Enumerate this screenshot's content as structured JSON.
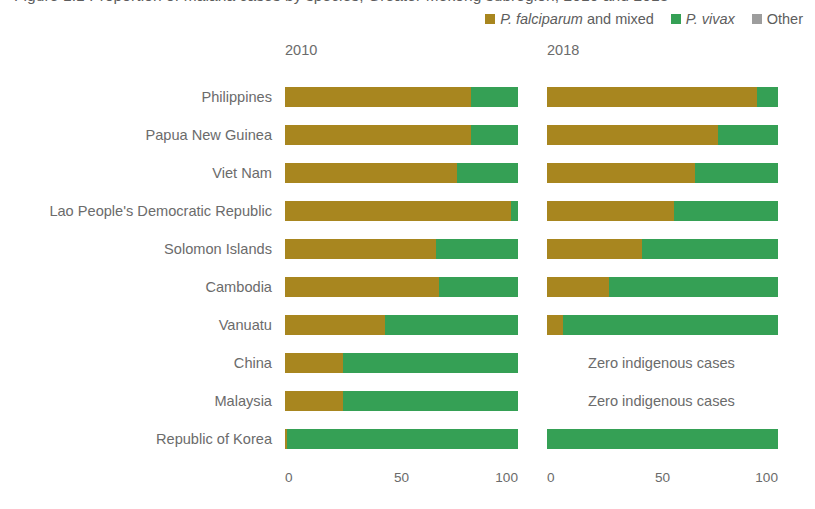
{
  "figure": {
    "title_clipped": "Figure 1.1  Proportion of malaria cases by species, Greater Mekong subregion, 2010 and 2018"
  },
  "legend": {
    "position": "top-right",
    "items": [
      {
        "id": "falciparum",
        "label_italic": "P. falciparum",
        "label_rest": " and mixed",
        "color": "#a8861f"
      },
      {
        "id": "vivax",
        "label_italic": "P. vivax",
        "label_rest": "",
        "color": "#35a055"
      },
      {
        "id": "other",
        "label_italic": "",
        "label_rest": "Other",
        "color": "#9d9d9d"
      }
    ]
  },
  "panels": [
    {
      "id": "p2010",
      "year_label": "2010"
    },
    {
      "id": "p2018",
      "year_label": "2018"
    }
  ],
  "axis": {
    "ticks": [
      "0",
      "50",
      "100"
    ],
    "min": 0,
    "max": 100
  },
  "zero_note": "Zero indigenous cases",
  "chart_data": {
    "type": "bar",
    "orientation": "horizontal",
    "stacked": true,
    "normalized_percent": true,
    "xlabel": "",
    "ylabel": "",
    "xlim": [
      0,
      100
    ],
    "grid": false,
    "legend_position": "top-right",
    "categories": [
      "Philippines",
      "Papua New Guinea",
      "Viet Nam",
      "Lao People's Democratic Republic",
      "Solomon Islands",
      "Cambodia",
      "Vanuatu",
      "China",
      "Malaysia",
      "Republic of Korea"
    ],
    "series_names": [
      "P. falciparum and mixed",
      "P. vivax",
      "Other"
    ],
    "series_colors": [
      "#a8861f",
      "#35a055",
      "#9d9d9d"
    ],
    "panels": [
      {
        "year": "2010",
        "values": [
          {
            "category": "Philippines",
            "falciparum": 80,
            "vivax": 20,
            "other": 0
          },
          {
            "category": "Papua New Guinea",
            "falciparum": 80,
            "vivax": 20,
            "other": 0
          },
          {
            "category": "Viet Nam",
            "falciparum": 74,
            "vivax": 26,
            "other": 0
          },
          {
            "category": "Lao People's Democratic Republic",
            "falciparum": 97,
            "vivax": 3,
            "other": 0
          },
          {
            "category": "Solomon Islands",
            "falciparum": 65,
            "vivax": 35,
            "other": 0
          },
          {
            "category": "Cambodia",
            "falciparum": 66,
            "vivax": 34,
            "other": 0
          },
          {
            "category": "Vanuatu",
            "falciparum": 43,
            "vivax": 57,
            "other": 0
          },
          {
            "category": "China",
            "falciparum": 25,
            "vivax": 75,
            "other": 0
          },
          {
            "category": "Malaysia",
            "falciparum": 25,
            "vivax": 75,
            "other": 0
          },
          {
            "category": "Republic of Korea",
            "falciparum": 1,
            "vivax": 99,
            "other": 0
          }
        ]
      },
      {
        "year": "2018",
        "values": [
          {
            "category": "Philippines",
            "falciparum": 91,
            "vivax": 9,
            "other": 0
          },
          {
            "category": "Papua New Guinea",
            "falciparum": 74,
            "vivax": 26,
            "other": 0
          },
          {
            "category": "Viet Nam",
            "falciparum": 64,
            "vivax": 36,
            "other": 0
          },
          {
            "category": "Lao People's Democratic Republic",
            "falciparum": 55,
            "vivax": 45,
            "other": 0
          },
          {
            "category": "Solomon Islands",
            "falciparum": 41,
            "vivax": 59,
            "other": 0
          },
          {
            "category": "Cambodia",
            "falciparum": 27,
            "vivax": 73,
            "other": 0
          },
          {
            "category": "Vanuatu",
            "falciparum": 7,
            "vivax": 93,
            "other": 0
          },
          {
            "category": "China",
            "no_data_note": "Zero indigenous cases"
          },
          {
            "category": "Malaysia",
            "no_data_note": "Zero indigenous cases"
          },
          {
            "category": "Republic of Korea",
            "falciparum": 0,
            "vivax": 100,
            "other": 0
          }
        ]
      }
    ]
  }
}
